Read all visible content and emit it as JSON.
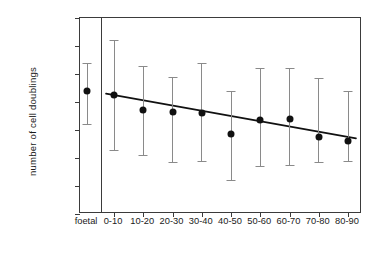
{
  "chart_data": {
    "type": "scatter",
    "title": "",
    "xlabel": "",
    "ylabel": "number of cell doublings",
    "ylim": [
      0,
      70
    ],
    "yticks": [
      0,
      10,
      20,
      30,
      40,
      50,
      60,
      70
    ],
    "ytick_labels": [
      "0",
      "10",
      "20",
      "30",
      "40",
      "50",
      "60",
      "70"
    ],
    "grid": false,
    "legend": "none",
    "error_bars": "vertical range bars with caps",
    "groups": [
      {
        "id": "foetal",
        "label": "foetal",
        "x_px": 86,
        "mean": 44,
        "low": 32,
        "high": 54,
        "panel": "left"
      }
    ],
    "categories": [
      "0-10",
      "10-20",
      "20-30",
      "30-40",
      "40-50",
      "50-60",
      "60-70",
      "70-80",
      "80-90"
    ],
    "values": [
      42.5,
      37,
      36.5,
      36,
      28.5,
      33.5,
      34,
      27.5,
      26
    ],
    "errors_low": [
      23,
      21,
      18.5,
      19,
      12,
      17,
      17.5,
      18.5,
      19
    ],
    "errors_high": [
      62,
      53,
      49,
      54,
      44,
      52,
      52,
      48.5,
      44
    ],
    "fit_line": {
      "type": "linear regression",
      "x_start_category": "0-10",
      "x_end_category": "80-90",
      "y_start": 43,
      "y_end": 27
    },
    "panels": [
      {
        "name": "foetal-panel",
        "categories": [
          "foetal"
        ]
      },
      {
        "name": "age-decade-panel",
        "categories": [
          "0-10",
          "10-20",
          "20-30",
          "30-40",
          "40-50",
          "50-60",
          "60-70",
          "70-80",
          "80-90"
        ]
      }
    ]
  },
  "colors": {
    "axis": "#3b3b3b",
    "marker": "#111111",
    "error_bar": "#8a8a8a",
    "fit_line": "#111111",
    "background": "#ffffff"
  }
}
